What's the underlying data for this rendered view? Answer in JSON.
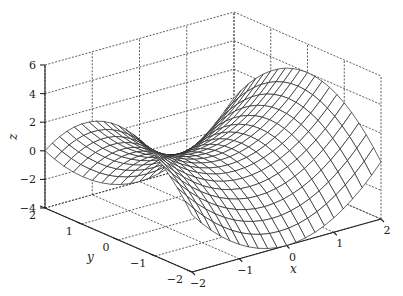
{
  "chart_data": {
    "type": "surface",
    "title": "",
    "function": "z = x^2 - y^2",
    "xlabel": "x",
    "ylabel": "y",
    "zlabel": "z",
    "xlim": [
      -2,
      2
    ],
    "ylim": [
      -2,
      2
    ],
    "zlim": [
      -4,
      6
    ],
    "xticks": [
      -2,
      -1,
      0,
      1,
      2
    ],
    "yticks": [
      -2,
      -1,
      0,
      1,
      2
    ],
    "zticks": [
      -4,
      -2,
      0,
      2,
      4,
      6
    ],
    "xtick_labels": [
      "−2",
      "−1",
      "0",
      "1",
      "2"
    ],
    "ytick_labels": [
      "−2",
      "−1",
      "0",
      "1",
      "2"
    ],
    "ztick_labels": [
      "−4",
      "−2",
      "0",
      "2",
      "4",
      "6"
    ],
    "mesh_resolution": 21,
    "grid": true,
    "style": "mesh (white faces, black edges)",
    "sample_points": [
      {
        "x": -2,
        "y": -2,
        "z": 0
      },
      {
        "x": -2,
        "y": 0,
        "z": 4
      },
      {
        "x": -2,
        "y": 2,
        "z": 0
      },
      {
        "x": 0,
        "y": -2,
        "z": -4
      },
      {
        "x": 0,
        "y": 0,
        "z": 0
      },
      {
        "x": 0,
        "y": 2,
        "z": -4
      },
      {
        "x": 2,
        "y": -2,
        "z": 0
      },
      {
        "x": 2,
        "y": 0,
        "z": 4
      },
      {
        "x": 2,
        "y": 2,
        "z": 0
      }
    ]
  },
  "projection": {
    "origin_px": [
      192,
      272
    ],
    "origin_xyz": [
      -2,
      -2,
      -4
    ],
    "x_unit_px": [
      47.25,
      -13.25
    ],
    "y_unit_px": [
      -36.75,
      -16.0
    ],
    "z_unit_px": [
      0,
      -14.3
    ]
  },
  "colors": {
    "background": "#ffffff",
    "mesh_edge": "#222222",
    "mesh_face": "#ffffff",
    "grid": "#333333"
  }
}
